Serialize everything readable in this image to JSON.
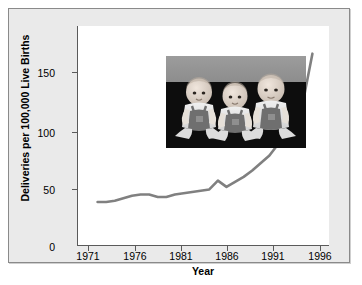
{
  "figure": {
    "background_color": "#eaeaea",
    "plot_background_color": "#ffffff",
    "line_color": "#808080",
    "axis_color": "#5a5a5a",
    "text_color": "#000000"
  },
  "inset": {
    "name": "triplets-photograph",
    "description": "Black and white photograph of three babies (triplets) seated side by side in overalls against a dark backdrop",
    "alt": "Three infants sitting in a row"
  },
  "chart_data": {
    "type": "line",
    "title": "",
    "subtitle": "",
    "xlabel": "Year",
    "ylabel": "Deliveries per 100,000 Live Births",
    "xlim": [
      1970,
      1997
    ],
    "ylim": [
      0,
      175
    ],
    "grid": false,
    "legend": null,
    "xticks": [
      1971,
      1976,
      1981,
      1986,
      1991,
      1996
    ],
    "xtick_labels": [
      "1971",
      "1976",
      "1981",
      "1986",
      "1991",
      "1996"
    ],
    "yticks": [
      0,
      50,
      100,
      150
    ],
    "ytick_labels": [
      "0",
      "50",
      "100",
      "150"
    ],
    "series": [
      {
        "name": "Triplet and higher-order multiple birth rate",
        "color": "#808080",
        "x": [
          1971,
          1972,
          1973,
          1974,
          1975,
          1976,
          1977,
          1978,
          1979,
          1980,
          1981,
          1982,
          1983,
          1984,
          1985,
          1986,
          1987,
          1988,
          1989,
          1990,
          1991,
          1992,
          1993,
          1994,
          1995,
          1996
        ],
        "values": [
          35,
          35,
          36,
          38,
          40,
          41,
          41,
          39,
          39,
          41,
          42,
          43,
          44,
          45,
          52,
          47,
          51,
          55,
          60,
          66,
          72,
          81,
          96,
          100,
          118,
          153
        ]
      }
    ]
  }
}
